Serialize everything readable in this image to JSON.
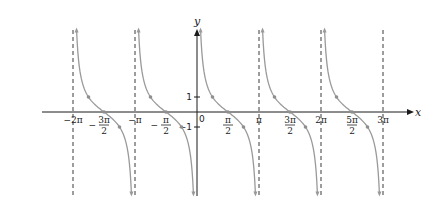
{
  "chart_data": {
    "type": "line",
    "title": "",
    "function": "y = cot x",
    "xlabel": "x",
    "ylabel": "y",
    "origin_label": "0",
    "xlim_rad": [
      -6.9,
      10.5
    ],
    "ylim": [
      -5.5,
      5.5
    ],
    "grid": false,
    "legend": null,
    "x_ticks": [
      {
        "value_pi": -2,
        "label": "−2π",
        "num": "",
        "den": "",
        "sign": "",
        "fraction": false
      },
      {
        "value_pi": -1.5,
        "label": "−3π/2",
        "num": "3π",
        "den": "2",
        "sign": "−",
        "fraction": true
      },
      {
        "value_pi": -1,
        "label": "−π",
        "num": "",
        "den": "",
        "sign": "",
        "fraction": false
      },
      {
        "value_pi": -0.5,
        "label": "−π/2",
        "num": "π",
        "den": "2",
        "sign": "−",
        "fraction": true
      },
      {
        "value_pi": 0.5,
        "label": "π/2",
        "num": "π",
        "den": "2",
        "sign": "",
        "fraction": true
      },
      {
        "value_pi": 1,
        "label": "π",
        "num": "",
        "den": "",
        "sign": "",
        "fraction": false
      },
      {
        "value_pi": 1.5,
        "label": "3π/2",
        "num": "3π",
        "den": "2",
        "sign": "",
        "fraction": true
      },
      {
        "value_pi": 2,
        "label": "2π",
        "num": "",
        "den": "",
        "sign": "",
        "fraction": false
      },
      {
        "value_pi": 2.5,
        "label": "5π/2",
        "num": "5π",
        "den": "2",
        "sign": "",
        "fraction": true
      },
      {
        "value_pi": 3,
        "label": "3π",
        "num": "",
        "den": "",
        "sign": "",
        "fraction": false
      }
    ],
    "y_ticks": [
      {
        "value": 1,
        "label": "1"
      },
      {
        "value": -1,
        "label": "−1"
      }
    ],
    "asymptotes_pi": [
      -2,
      -1,
      0,
      1,
      2,
      3
    ],
    "branches_pi": [
      [
        -2,
        -1
      ],
      [
        -1,
        0
      ],
      [
        0,
        1
      ],
      [
        1,
        2
      ],
      [
        2,
        3
      ]
    ],
    "marked_points": [
      {
        "x_pi": -1.75,
        "y": 1
      },
      {
        "x_pi": -1.5,
        "y": 0
      },
      {
        "x_pi": -1.25,
        "y": -1
      },
      {
        "x_pi": -0.75,
        "y": 1
      },
      {
        "x_pi": -0.5,
        "y": 0
      },
      {
        "x_pi": -0.25,
        "y": -1
      },
      {
        "x_pi": 0.25,
        "y": 1
      },
      {
        "x_pi": 0.5,
        "y": 0
      },
      {
        "x_pi": 0.75,
        "y": -1
      },
      {
        "x_pi": 1.25,
        "y": 1
      },
      {
        "x_pi": 1.5,
        "y": 0
      },
      {
        "x_pi": 1.75,
        "y": -1
      },
      {
        "x_pi": 2.25,
        "y": 1
      },
      {
        "x_pi": 2.5,
        "y": 0
      },
      {
        "x_pi": 2.75,
        "y": -1
      }
    ],
    "colors": {
      "axis": "#1a1a1a",
      "curve": "#9a9a9a",
      "asymptote": "#3a3a3a"
    }
  },
  "layout_px": {
    "origin_x": 197,
    "origin_y": 112,
    "px_per_pi": 62,
    "px_per_unit_y": 15,
    "x_axis_start": 42,
    "x_axis_end": 414,
    "y_axis_top": 29,
    "y_axis_bottom": 196,
    "asym_top": 30,
    "asym_bottom": 196
  }
}
